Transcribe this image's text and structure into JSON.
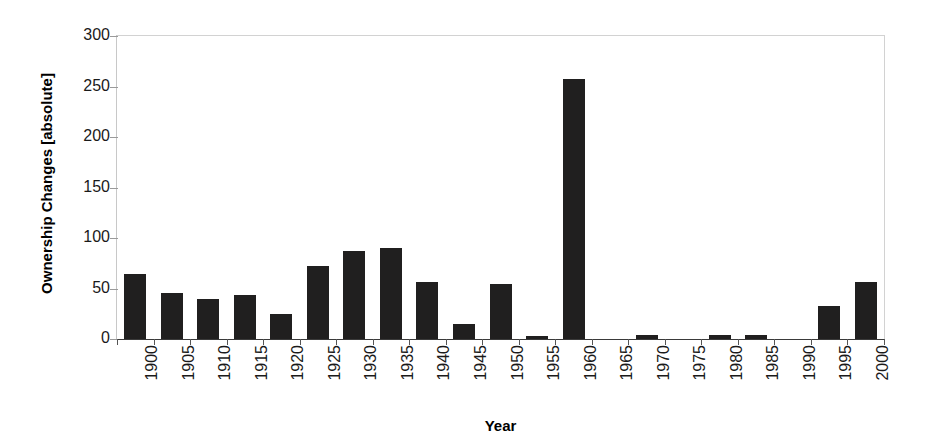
{
  "chart_data": {
    "type": "bar",
    "title": "",
    "xlabel": "Year",
    "ylabel": "Ownership Changes [absolute]",
    "categories": [
      "1900",
      "1905",
      "1910",
      "1915",
      "1920",
      "1925",
      "1930",
      "1935",
      "1940",
      "1945",
      "1950",
      "1955",
      "1960",
      "1965",
      "1970",
      "1975",
      "1980",
      "1985",
      "1990",
      "1995",
      "2000"
    ],
    "values": [
      64,
      46,
      40,
      44,
      25,
      72,
      87,
      90,
      56,
      15,
      54,
      3,
      257,
      0,
      4,
      0,
      4,
      4,
      0,
      33,
      56
    ],
    "ylim": [
      0,
      300
    ],
    "y_ticks": [
      0,
      50,
      100,
      150,
      200,
      250,
      300
    ],
    "y_tick_labels": [
      "0",
      "50",
      "100",
      "150",
      "200",
      "250",
      "300"
    ],
    "grid": false,
    "legend": "none",
    "bar_color": "#201f1f",
    "axis_color": "#3a3a3a",
    "frame_color": "#d2d2d2",
    "background": "#ffffff"
  }
}
